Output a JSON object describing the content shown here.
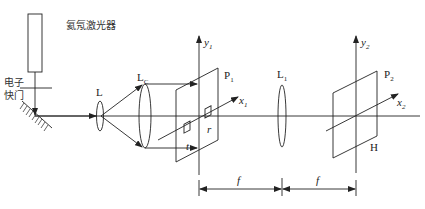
{
  "diagram": {
    "type": "optical-setup",
    "labels": {
      "laser": "氦氖激光器",
      "shutter_line1": "电子",
      "shutter_line2": "快门",
      "lens_L": "L",
      "lens_Lc_main": "L",
      "lens_Lc_sub": "C",
      "plane_P1_main": "P",
      "plane_P1_sub": "1",
      "axis_y1_main": "y",
      "axis_y1_sub": "1",
      "axis_x1_main": "x",
      "axis_x1_sub": "1",
      "object_t": "t",
      "object_r": "r",
      "lens_L1_main": "L",
      "lens_L1_sub": "1",
      "plane_P2_main": "P",
      "plane_P2_sub": "2",
      "axis_y2_main": "y",
      "axis_y2_sub": "2",
      "axis_x2_main": "x",
      "axis_x2_sub": "2",
      "filter_H": "H",
      "focal_1": "f",
      "focal_2": "f"
    },
    "colors": {
      "line": "#222222",
      "background": "#ffffff"
    }
  }
}
